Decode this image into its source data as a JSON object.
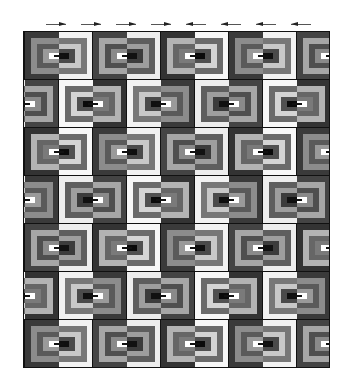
{
  "image": {
    "description": "Log cabin quilt pattern, grayscale, with direction arrows above",
    "background": "#ffffff"
  },
  "arrows": [
    {
      "x": 46,
      "direction": "right"
    },
    {
      "x": 81,
      "direction": "right"
    },
    {
      "x": 116,
      "direction": "right"
    },
    {
      "x": 151,
      "direction": "right"
    },
    {
      "x": 186,
      "direction": "left"
    },
    {
      "x": 221,
      "direction": "left"
    },
    {
      "x": 256,
      "direction": "left"
    },
    {
      "x": 291,
      "direction": "left"
    }
  ],
  "quilt": {
    "x": 23,
    "y": 31,
    "width": 307,
    "height": 337,
    "rows": 7,
    "row_height": 48,
    "block_width": 68,
    "line_color": "#111111",
    "row_offsets": [
      0,
      -34,
      0,
      -34,
      0,
      -34,
      0
    ],
    "row_mirrored": [
      false,
      true,
      false,
      true,
      false,
      true,
      false
    ],
    "dark_tones": [
      "#3a3a3a",
      "#8c8c8c",
      "#5a5a5a",
      "#9a9a9a",
      "#ffffff"
    ],
    "light_tones": [
      "#f2f2f2",
      "#777777",
      "#c8c8c8",
      "#4a4a4a",
      "#0f0f0f"
    ],
    "tone_variants": [
      {
        "dark": [
          "#3a3a3a",
          "#8c8c8c",
          "#5a5a5a",
          "#9a9a9a",
          "#ffffff"
        ],
        "light": [
          "#f2f2f2",
          "#777777",
          "#c8c8c8",
          "#4a4a4a",
          "#0f0f0f"
        ]
      },
      {
        "dark": [
          "#444444",
          "#a6a6a6",
          "#4f4f4f",
          "#8a8a8a",
          "#ffffff"
        ],
        "light": [
          "#ededed",
          "#5e5e5e",
          "#9e9e9e",
          "#3c3c3c",
          "#111111"
        ]
      },
      {
        "dark": [
          "#333333",
          "#b3b3b3",
          "#666666",
          "#7a7a7a",
          "#ffffff"
        ],
        "light": [
          "#f7f7f7",
          "#6a6a6a",
          "#d4d4d4",
          "#505050",
          "#0a0a0a"
        ]
      }
    ]
  }
}
